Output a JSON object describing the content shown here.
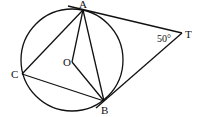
{
  "diagram": {
    "points": {
      "A": {
        "label": "A"
      },
      "B": {
        "label": "B"
      },
      "C": {
        "label": "C"
      },
      "O": {
        "label": "O"
      },
      "T": {
        "label": "T"
      }
    },
    "angle_T": "50°"
  }
}
